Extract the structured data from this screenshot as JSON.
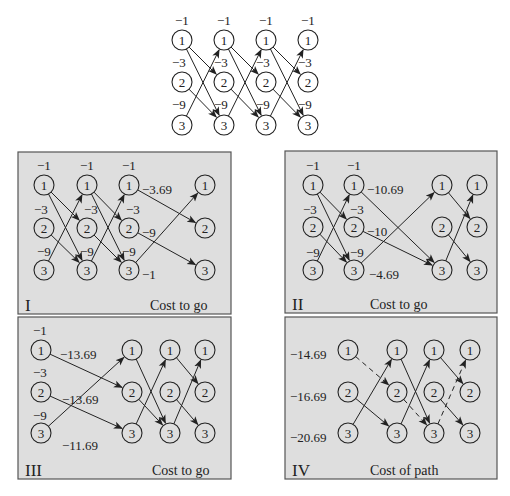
{
  "figure": {
    "node_radius": 10,
    "colors": {
      "panel_fill": "#dedede",
      "panel_border": "#555555",
      "ink": "#222222",
      "background": "#ffffff"
    }
  },
  "top_diagram": {
    "name": "full-trellis",
    "columns_x": [
      182,
      224,
      266,
      308
    ],
    "rows_y": [
      40,
      82,
      125
    ],
    "node_labels": [
      "1",
      "2",
      "3"
    ],
    "edges_per_stage": [
      [
        0,
        1
      ],
      [
        0,
        2
      ],
      [
        1,
        2
      ],
      [
        2,
        0
      ]
    ],
    "edge_weight_labels": [
      {
        "text": "−1",
        "x": 175,
        "y": 20
      },
      {
        "text": "−1",
        "x": 217,
        "y": 20
      },
      {
        "text": "−1",
        "x": 259,
        "y": 20
      },
      {
        "text": "−1",
        "x": 301,
        "y": 20
      },
      {
        "text": "−3",
        "x": 172,
        "y": 62
      },
      {
        "text": "−3",
        "x": 214,
        "y": 62
      },
      {
        "text": "−3",
        "x": 256,
        "y": 62
      },
      {
        "text": "−3",
        "x": 298,
        "y": 62
      },
      {
        "text": "−9",
        "x": 172,
        "y": 104
      },
      {
        "text": "−9",
        "x": 214,
        "y": 104
      },
      {
        "text": "−9",
        "x": 256,
        "y": 104
      },
      {
        "text": "−9",
        "x": 298,
        "y": 104
      }
    ]
  },
  "panels": [
    {
      "id": "I",
      "roman": "I",
      "caption": "Cost to go",
      "box": {
        "x": 18,
        "y": 152,
        "w": 213,
        "h": 162
      },
      "roman_pos": {
        "x": 25,
        "y": 305
      },
      "caption_pos": {
        "x": 150,
        "y": 305
      },
      "columns_x": [
        44,
        87,
        129,
        205
      ],
      "rows_y": [
        185,
        228,
        270
      ],
      "edges": [
        {
          "from": [
            0,
            0
          ],
          "to": [
            1,
            1
          ]
        },
        {
          "from": [
            0,
            0
          ],
          "to": [
            1,
            2
          ]
        },
        {
          "from": [
            0,
            1
          ],
          "to": [
            1,
            2
          ]
        },
        {
          "from": [
            0,
            2
          ],
          "to": [
            1,
            0
          ]
        },
        {
          "from": [
            1,
            0
          ],
          "to": [
            2,
            1
          ]
        },
        {
          "from": [
            1,
            0
          ],
          "to": [
            2,
            2
          ]
        },
        {
          "from": [
            1,
            1
          ],
          "to": [
            2,
            2
          ]
        },
        {
          "from": [
            1,
            2
          ],
          "to": [
            2,
            0
          ]
        },
        {
          "from": [
            2,
            0
          ],
          "to": [
            3,
            1
          ]
        },
        {
          "from": [
            2,
            1
          ],
          "to": [
            3,
            2
          ]
        },
        {
          "from": [
            2,
            2
          ],
          "to": [
            3,
            0
          ]
        }
      ],
      "labels": [
        {
          "text": "−1",
          "x": 37,
          "y": 165
        },
        {
          "text": "−1",
          "x": 80,
          "y": 165
        },
        {
          "text": "−1",
          "x": 122,
          "y": 165
        },
        {
          "text": "−3",
          "x": 34,
          "y": 209
        },
        {
          "text": "−3",
          "x": 84,
          "y": 209
        },
        {
          "text": "−3",
          "x": 126,
          "y": 209
        },
        {
          "text": "−9",
          "x": 37,
          "y": 251
        },
        {
          "text": "−9",
          "x": 80,
          "y": 251
        },
        {
          "text": "−9",
          "x": 122,
          "y": 251
        },
        {
          "text": "−3.69",
          "x": 142,
          "y": 189
        },
        {
          "text": "−9",
          "x": 142,
          "y": 232
        },
        {
          "text": "−1",
          "x": 142,
          "y": 274
        }
      ]
    },
    {
      "id": "II",
      "roman": "II",
      "caption": "Cost to go",
      "box": {
        "x": 285,
        "y": 151,
        "w": 212,
        "h": 162
      },
      "roman_pos": {
        "x": 292,
        "y": 304
      },
      "caption_pos": {
        "x": 370,
        "y": 304
      },
      "columns_x": [
        313,
        354,
        442,
        477
      ],
      "rows_y": [
        185,
        227,
        270
      ],
      "edges": [
        {
          "from": [
            0,
            0
          ],
          "to": [
            1,
            1
          ]
        },
        {
          "from": [
            0,
            0
          ],
          "to": [
            1,
            2
          ]
        },
        {
          "from": [
            0,
            1
          ],
          "to": [
            1,
            2
          ]
        },
        {
          "from": [
            0,
            2
          ],
          "to": [
            1,
            0
          ]
        },
        {
          "from": [
            1,
            0
          ],
          "to": [
            2,
            2
          ]
        },
        {
          "from": [
            1,
            1
          ],
          "to": [
            2,
            2
          ]
        },
        {
          "from": [
            1,
            2
          ],
          "to": [
            2,
            0
          ]
        },
        {
          "from": [
            2,
            0
          ],
          "to": [
            3,
            1
          ]
        },
        {
          "from": [
            2,
            1
          ],
          "to": [
            3,
            2
          ]
        },
        {
          "from": [
            2,
            2
          ],
          "to": [
            3,
            0
          ]
        }
      ],
      "labels": [
        {
          "text": "−1",
          "x": 306,
          "y": 165
        },
        {
          "text": "−1",
          "x": 347,
          "y": 165
        },
        {
          "text": "−3",
          "x": 303,
          "y": 209
        },
        {
          "text": "−3",
          "x": 350,
          "y": 209
        },
        {
          "text": "−9",
          "x": 306,
          "y": 252
        },
        {
          "text": "−9",
          "x": 350,
          "y": 252
        },
        {
          "text": "−10.69",
          "x": 367,
          "y": 189
        },
        {
          "text": "−10",
          "x": 367,
          "y": 231
        },
        {
          "text": "−4.69",
          "x": 369,
          "y": 274
        }
      ]
    },
    {
      "id": "III",
      "roman": "III",
      "caption": "Cost to go",
      "box": {
        "x": 18,
        "y": 317,
        "w": 213,
        "h": 162
      },
      "roman_pos": {
        "x": 25,
        "y": 470
      },
      "caption_pos": {
        "x": 152,
        "y": 470
      },
      "columns_x": [
        41,
        132,
        170,
        205
      ],
      "rows_y": [
        350,
        392,
        433
      ],
      "edges": [
        {
          "from": [
            0,
            0
          ],
          "to": [
            1,
            1
          ]
        },
        {
          "from": [
            0,
            1
          ],
          "to": [
            1,
            2
          ]
        },
        {
          "from": [
            0,
            2
          ],
          "to": [
            1,
            0
          ]
        },
        {
          "from": [
            1,
            0
          ],
          "to": [
            2,
            2
          ]
        },
        {
          "from": [
            1,
            1
          ],
          "to": [
            2,
            2
          ]
        },
        {
          "from": [
            1,
            2
          ],
          "to": [
            2,
            0
          ]
        },
        {
          "from": [
            2,
            0
          ],
          "to": [
            3,
            1
          ]
        },
        {
          "from": [
            2,
            1
          ],
          "to": [
            3,
            2
          ]
        },
        {
          "from": [
            2,
            2
          ],
          "to": [
            3,
            0
          ]
        }
      ],
      "labels": [
        {
          "text": "−1",
          "x": 33,
          "y": 330
        },
        {
          "text": "−3",
          "x": 33,
          "y": 372
        },
        {
          "text": "−9",
          "x": 33,
          "y": 415
        },
        {
          "text": "−13.69",
          "x": 60,
          "y": 354
        },
        {
          "text": "−13.69",
          "x": 62,
          "y": 399
        },
        {
          "text": "−11.69",
          "x": 62,
          "y": 445
        }
      ]
    },
    {
      "id": "IV",
      "roman": "IV",
      "caption": "Cost of path",
      "box": {
        "x": 285,
        "y": 317,
        "w": 212,
        "h": 162
      },
      "roman_pos": {
        "x": 292,
        "y": 470
      },
      "caption_pos": {
        "x": 370,
        "y": 470
      },
      "columns_x": [
        348,
        397,
        434,
        470
      ],
      "rows_y": [
        350,
        392,
        433
      ],
      "edges": [
        {
          "from": [
            0,
            0
          ],
          "to": [
            1,
            1
          ],
          "dashed": true
        },
        {
          "from": [
            0,
            1
          ],
          "to": [
            1,
            2
          ]
        },
        {
          "from": [
            0,
            2
          ],
          "to": [
            1,
            0
          ]
        },
        {
          "from": [
            1,
            0
          ],
          "to": [
            2,
            2
          ]
        },
        {
          "from": [
            1,
            1
          ],
          "to": [
            2,
            2
          ],
          "dashed": true
        },
        {
          "from": [
            1,
            2
          ],
          "to": [
            2,
            0
          ]
        },
        {
          "from": [
            2,
            0
          ],
          "to": [
            3,
            1
          ]
        },
        {
          "from": [
            2,
            1
          ],
          "to": [
            3,
            2
          ]
        },
        {
          "from": [
            2,
            2
          ],
          "to": [
            3,
            0
          ],
          "dashed": true
        }
      ],
      "labels": [
        {
          "text": "−14.69",
          "x": 290,
          "y": 354
        },
        {
          "text": "−16.69",
          "x": 290,
          "y": 396
        },
        {
          "text": "−20.69",
          "x": 290,
          "y": 437
        }
      ]
    }
  ]
}
